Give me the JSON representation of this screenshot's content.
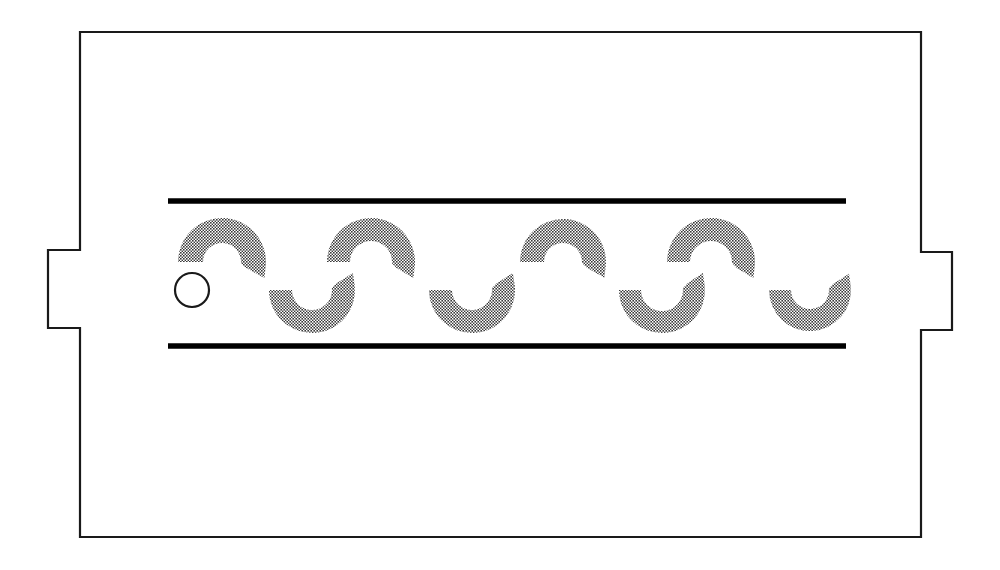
{
  "figure": {
    "background_color": "#ffffff",
    "canvas": {
      "width": 1000,
      "height": 570
    }
  },
  "outline": {
    "name": "blade-body-outline",
    "stroke_color": "#1a1a1a",
    "fill_color": "#ffffff",
    "stroke_width": 2.2,
    "left_edge_x": 80,
    "right_edge_x": 921,
    "top_edge_y": 32,
    "bottom_edge_y": 537,
    "left_tab": {
      "outer_x": 48,
      "top_y": 250,
      "bottom_y": 328
    },
    "right_tab": {
      "outer_x": 952,
      "top_y": 252,
      "bottom_y": 330
    },
    "path": "M 80,32 L 921,32 L 921,252 L 952,252 L 952,330 L 921,330 L 921,537 L 80,537 L 80,328 L 48,328 L 48,250 L 80,250 Z"
  },
  "rails": {
    "name": "guide-rails",
    "color": "#000000",
    "thickness": 5.5,
    "start_x": 168,
    "end_x": 846,
    "items": [
      {
        "label": "upper-rail",
        "y": 201
      },
      {
        "label": "lower-rail",
        "y": 346
      }
    ]
  },
  "crescents": {
    "name": "halftone-crescents",
    "fill_color": "#6e6e6e",
    "pattern": "halftone-checker",
    "outer_radius": 44,
    "inner_radius": 19,
    "top_row": {
      "orientation": "opens-down",
      "center_y": 262,
      "items": [
        {
          "label": "top-crescent-1",
          "cx": 222,
          "outer_r": 44,
          "inner_r": 19
        },
        {
          "label": "top-crescent-2",
          "cx": 371,
          "outer_r": 44,
          "inner_r": 21
        },
        {
          "label": "top-crescent-3",
          "cx": 563,
          "outer_r": 43,
          "inner_r": 19
        },
        {
          "label": "top-crescent-4",
          "cx": 711,
          "outer_r": 44,
          "inner_r": 21
        }
      ]
    },
    "bottom_row": {
      "orientation": "opens-up",
      "center_y": 290,
      "items": [
        {
          "label": "bottom-crescent-1",
          "cx": 312,
          "outer_r": 43,
          "inner_r": 20
        },
        {
          "label": "bottom-crescent-2",
          "cx": 472,
          "outer_r": 43,
          "inner_r": 20
        },
        {
          "label": "bottom-crescent-3",
          "cx": 662,
          "outer_r": 43,
          "inner_r": 21
        },
        {
          "label": "bottom-crescent-4",
          "cx": 810,
          "outer_r": 41,
          "inner_r": 19
        }
      ]
    }
  },
  "pin": {
    "name": "pin-circle",
    "cx": 192,
    "cy": 290,
    "r": 17,
    "fill_color": "#ffffff",
    "stroke_color": "#1a1a1a"
  }
}
